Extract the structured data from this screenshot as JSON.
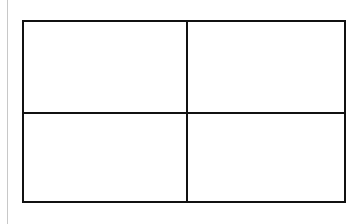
{
  "diagram": {
    "type": "grid",
    "rows": 2,
    "columns": 2,
    "cells": [
      {
        "row": 1,
        "col": 1,
        "label": ""
      },
      {
        "row": 1,
        "col": 2,
        "label": ""
      },
      {
        "row": 2,
        "col": 1,
        "label": ""
      },
      {
        "row": 2,
        "col": 2,
        "label": ""
      }
    ],
    "colors": {
      "background": "#ffffff",
      "stroke": "#111111",
      "edge_line": "#c8c8c8"
    }
  }
}
